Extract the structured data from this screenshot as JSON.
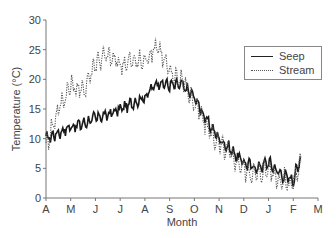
{
  "chart_data": {
    "type": "line",
    "title": "",
    "xlabel": "Month",
    "ylabel": "Temperature (°C)",
    "ylim": [
      0,
      30
    ],
    "yticks": [
      0,
      5,
      10,
      15,
      20,
      25,
      30
    ],
    "xticks": [
      "A",
      "M",
      "J",
      "J",
      "A",
      "S",
      "O",
      "N",
      "D",
      "J",
      "F",
      "M"
    ],
    "grid": false,
    "legend_position": "upper right",
    "x": [
      0,
      0.5,
      1,
      1.5,
      2,
      2.5,
      3,
      3.5,
      4,
      4.5,
      5,
      5.5,
      6,
      6.5,
      7,
      7.5,
      8,
      8.5,
      9,
      9.5,
      10,
      10.3
    ],
    "series": [
      {
        "name": "Seep",
        "style": "solid",
        "values": [
          10,
          11,
          12,
          12.5,
          13.5,
          14,
          15,
          16,
          17,
          19.5,
          19,
          19,
          17,
          13,
          10,
          8,
          6,
          5,
          6,
          4,
          3,
          7
        ]
      },
      {
        "name": "Stream",
        "style": "dotted",
        "values": [
          9,
          15,
          19,
          18,
          23,
          24,
          22.5,
          23,
          23,
          26,
          21,
          20,
          16,
          12,
          9,
          7,
          5,
          4,
          5,
          3,
          2.5,
          6
        ]
      }
    ]
  },
  "legend": {
    "items": [
      {
        "label": "Seep"
      },
      {
        "label": "Stream"
      }
    ]
  }
}
